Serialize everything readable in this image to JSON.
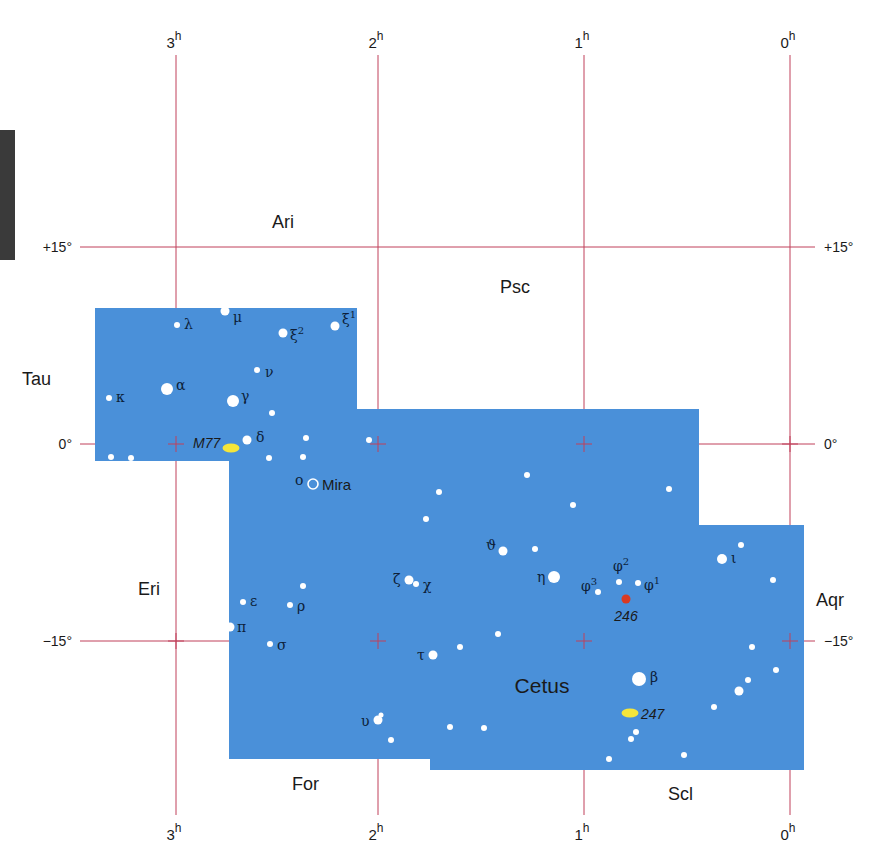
{
  "map": {
    "constellation": "Cetus",
    "area_color": "#4a90d9",
    "grid_color": "#c0405a",
    "ra_labels": [
      {
        "label": "3",
        "sup": "h",
        "x": 176
      },
      {
        "label": "2",
        "sup": "h",
        "x": 378
      },
      {
        "label": "1",
        "sup": "h",
        "x": 584
      },
      {
        "label": "0",
        "sup": "h",
        "x": 790
      }
    ],
    "dec_labels": [
      {
        "label": "+15°",
        "y": 247
      },
      {
        "label": "0°",
        "y": 444
      },
      {
        "label": "−15°",
        "y": 641
      }
    ],
    "neighbors": [
      {
        "name": "Ari",
        "x": 272,
        "y": 228
      },
      {
        "name": "Psc",
        "x": 500,
        "y": 293
      },
      {
        "name": "Tau",
        "x": 22,
        "y": 385
      },
      {
        "name": "Eri",
        "x": 138,
        "y": 595
      },
      {
        "name": "Aqr",
        "x": 816,
        "y": 606
      },
      {
        "name": "For",
        "x": 292,
        "y": 790
      },
      {
        "name": "Scl",
        "x": 668,
        "y": 800
      }
    ],
    "title_label": {
      "name": "Cetus",
      "x": 500,
      "y": 693
    },
    "stars": [
      {
        "x": 225,
        "y": 311,
        "r": 4.5,
        "label": "μ",
        "lx": 233,
        "ly": 322
      },
      {
        "x": 177,
        "y": 325,
        "r": 3,
        "label": "λ",
        "lx": 184,
        "ly": 329
      },
      {
        "x": 283,
        "y": 333,
        "r": 4.5,
        "label": "ξ2",
        "lx": 290,
        "ly": 340
      },
      {
        "x": 335,
        "y": 326,
        "r": 4.5,
        "label": "ξ1",
        "lx": 342,
        "ly": 324
      },
      {
        "x": 257,
        "y": 370,
        "r": 3,
        "label": "ν",
        "lx": 265,
        "ly": 377
      },
      {
        "x": 167,
        "y": 389,
        "r": 6,
        "label": "α",
        "lx": 176,
        "ly": 390
      },
      {
        "x": 109,
        "y": 398,
        "r": 3,
        "label": "κ",
        "lx": 116,
        "ly": 402
      },
      {
        "x": 233,
        "y": 401,
        "r": 6,
        "label": "γ",
        "lx": 241,
        "ly": 401
      },
      {
        "x": 272,
        "y": 413,
        "r": 3
      },
      {
        "x": 247,
        "y": 440,
        "r": 4.5,
        "label": "δ",
        "lx": 256,
        "ly": 442
      },
      {
        "x": 306,
        "y": 438,
        "r": 3
      },
      {
        "x": 369,
        "y": 440,
        "r": 3
      },
      {
        "x": 111,
        "y": 457,
        "r": 3
      },
      {
        "x": 131,
        "y": 458,
        "r": 3
      },
      {
        "x": 269,
        "y": 458,
        "r": 3
      },
      {
        "x": 303,
        "y": 457,
        "r": 3
      },
      {
        "x": 527,
        "y": 475,
        "r": 3
      },
      {
        "x": 669,
        "y": 489,
        "r": 3
      },
      {
        "x": 439,
        "y": 492,
        "r": 3
      },
      {
        "x": 573,
        "y": 505,
        "r": 3
      },
      {
        "x": 426,
        "y": 519,
        "r": 3
      },
      {
        "x": 503,
        "y": 551,
        "r": 4.5,
        "label": "ϑ",
        "lx": 486,
        "ly": 550
      },
      {
        "x": 535,
        "y": 549,
        "r": 3
      },
      {
        "x": 741,
        "y": 545,
        "r": 3
      },
      {
        "x": 554,
        "y": 577,
        "r": 6,
        "label": "η",
        "lx": 537,
        "ly": 582
      },
      {
        "x": 619,
        "y": 582,
        "r": 3,
        "label": "φ2",
        "lx": 613,
        "ly": 571
      },
      {
        "x": 638,
        "y": 583,
        "r": 3,
        "label": "φ1",
        "lx": 644,
        "ly": 590
      },
      {
        "x": 598,
        "y": 592,
        "r": 3,
        "label": "φ3",
        "lx": 581,
        "ly": 591
      },
      {
        "x": 722,
        "y": 559,
        "r": 5,
        "label": "ι",
        "lx": 731,
        "ly": 563
      },
      {
        "x": 773,
        "y": 580,
        "r": 3
      },
      {
        "x": 409,
        "y": 580,
        "r": 4.5,
        "label": "ζ",
        "lx": 393,
        "ly": 584
      },
      {
        "x": 416,
        "y": 584,
        "r": 3,
        "label": "χ",
        "lx": 423,
        "ly": 590
      },
      {
        "x": 303,
        "y": 586,
        "r": 3
      },
      {
        "x": 243,
        "y": 602,
        "r": 3,
        "label": "ε",
        "lx": 250,
        "ly": 606
      },
      {
        "x": 290,
        "y": 605,
        "r": 3,
        "label": "ρ",
        "lx": 297,
        "ly": 611
      },
      {
        "x": 230,
        "y": 627,
        "r": 4.5,
        "label": "π",
        "lx": 237,
        "ly": 632
      },
      {
        "x": 498,
        "y": 634,
        "r": 3
      },
      {
        "x": 270,
        "y": 644,
        "r": 3,
        "label": "σ",
        "lx": 277,
        "ly": 650
      },
      {
        "x": 460,
        "y": 647,
        "r": 3
      },
      {
        "x": 433,
        "y": 655,
        "r": 4.5,
        "label": "τ",
        "lx": 417,
        "ly": 660
      },
      {
        "x": 752,
        "y": 647,
        "r": 3
      },
      {
        "x": 776,
        "y": 670,
        "r": 3
      },
      {
        "x": 639,
        "y": 679,
        "r": 7,
        "label": "β",
        "lx": 650,
        "ly": 682
      },
      {
        "x": 748,
        "y": 680,
        "r": 3
      },
      {
        "x": 739,
        "y": 691,
        "r": 4.5
      },
      {
        "x": 714,
        "y": 707,
        "r": 3
      },
      {
        "x": 378,
        "y": 720,
        "r": 4.5,
        "label": "υ",
        "lx": 361,
        "ly": 726
      },
      {
        "x": 381,
        "y": 715,
        "r": 2.5
      },
      {
        "x": 450,
        "y": 727,
        "r": 3
      },
      {
        "x": 636,
        "y": 732,
        "r": 3
      },
      {
        "x": 631,
        "y": 739,
        "r": 3
      },
      {
        "x": 484,
        "y": 728,
        "r": 3
      },
      {
        "x": 391,
        "y": 740,
        "r": 3
      },
      {
        "x": 684,
        "y": 755,
        "r": 3
      },
      {
        "x": 609,
        "y": 759,
        "r": 3
      }
    ],
    "mira": {
      "x": 313,
      "y": 484,
      "label_greek": "ο",
      "label": "Mira"
    },
    "deep_sky": [
      {
        "id": "M77",
        "x": 231,
        "y": 448,
        "color": "#f5e63a",
        "type": "galaxy"
      },
      {
        "id": "247",
        "x": 630,
        "y": 713,
        "color": "#f5e63a",
        "type": "galaxy"
      },
      {
        "id": "246",
        "x": 626,
        "y": 599,
        "color": "#d93a22",
        "type": "planetary-nebula"
      }
    ]
  }
}
